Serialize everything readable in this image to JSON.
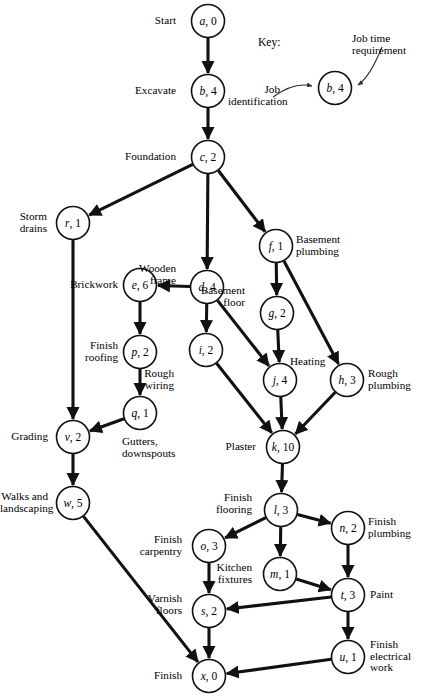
{
  "figure": {
    "type": "project-network-diagram",
    "title": "",
    "width": 426,
    "height": 698,
    "background": "#ffffff",
    "line_color": "#111111"
  },
  "key": {
    "title": "Key:",
    "sample_node": {
      "id": "b",
      "time": "4",
      "text": "b, 4"
    },
    "job_identification_label": "Job\nidentification",
    "job_time_label": "Job time\nrequirement"
  },
  "nodes": [
    {
      "id": "a",
      "time": "0",
      "text": "a, 0",
      "label": "Start",
      "label_pos": "left"
    },
    {
      "id": "b",
      "time": "4",
      "text": "b, 4",
      "label": "Excavate",
      "label_pos": "left"
    },
    {
      "id": "c",
      "time": "2",
      "text": "c, 2",
      "label": "Foundation",
      "label_pos": "left"
    },
    {
      "id": "r",
      "time": "1",
      "text": "r, 1",
      "label": "Storm\ndrains",
      "label_pos": "left"
    },
    {
      "id": "d",
      "time": "4",
      "text": "d, 4",
      "label": "Wooden\nframe",
      "label_pos": "left"
    },
    {
      "id": "f",
      "time": "1",
      "text": "f, 1",
      "label": "Basement\nplumbing",
      "label_pos": "right"
    },
    {
      "id": "e",
      "time": "6",
      "text": "e, 6",
      "label": "Brickwork",
      "label_pos": "left"
    },
    {
      "id": "g",
      "time": "2",
      "text": "g, 2",
      "label": "Basement\nfloor",
      "label_pos": "left"
    },
    {
      "id": "p",
      "time": "2",
      "text": "p, 2",
      "label": "Finish\nroofing",
      "label_pos": "left"
    },
    {
      "id": "i",
      "time": "2",
      "text": "i, 2",
      "label": "Rough\nwiring",
      "label_pos": "below-left"
    },
    {
      "id": "j",
      "time": "4",
      "text": "j, 4",
      "label": "Heating",
      "label_pos": "right"
    },
    {
      "id": "h",
      "time": "3",
      "text": "h, 3",
      "label": "Rough\nplumbing",
      "label_pos": "right"
    },
    {
      "id": "q",
      "time": "1",
      "text": "q, 1",
      "label": "Gutters,\ndownspouts",
      "label_pos": "below"
    },
    {
      "id": "v",
      "time": "2",
      "text": "v, 2",
      "label": "Grading",
      "label_pos": "left"
    },
    {
      "id": "k",
      "time": "10",
      "text": "k, 10",
      "label": "Plaster",
      "label_pos": "left"
    },
    {
      "id": "w",
      "time": "5",
      "text": "w, 5",
      "label": "Walks and\nlandscaping",
      "label_pos": "left"
    },
    {
      "id": "l",
      "time": "3",
      "text": "l, 3",
      "label": "Finish\nflooring",
      "label_pos": "left"
    },
    {
      "id": "n",
      "time": "2",
      "text": "n, 2",
      "label": "Finish\nplumbing",
      "label_pos": "right"
    },
    {
      "id": "o",
      "time": "3",
      "text": "o, 3",
      "label": "Finish\ncarpentry",
      "label_pos": "left"
    },
    {
      "id": "m",
      "time": "1",
      "text": "m, 1",
      "label": "Kitchen\nfixtures",
      "label_pos": "left"
    },
    {
      "id": "t",
      "time": "3",
      "text": "t, 3",
      "label": "Paint",
      "label_pos": "right"
    },
    {
      "id": "s",
      "time": "2",
      "text": "s, 2",
      "label": "Varnish\nfloors",
      "label_pos": "left"
    },
    {
      "id": "u",
      "time": "1",
      "text": "u, 1",
      "label": "Finish\nelectrical\nwork",
      "label_pos": "right"
    },
    {
      "id": "x",
      "time": "0",
      "text": "x, 0",
      "label": "Finish",
      "label_pos": "left"
    }
  ],
  "edges": [
    {
      "from": "a",
      "to": "b"
    },
    {
      "from": "b",
      "to": "c"
    },
    {
      "from": "c",
      "to": "r"
    },
    {
      "from": "c",
      "to": "d"
    },
    {
      "from": "c",
      "to": "f"
    },
    {
      "from": "d",
      "to": "e"
    },
    {
      "from": "d",
      "to": "i"
    },
    {
      "from": "d",
      "to": "j"
    },
    {
      "from": "e",
      "to": "p"
    },
    {
      "from": "f",
      "to": "g"
    },
    {
      "from": "f",
      "to": "h"
    },
    {
      "from": "g",
      "to": "j"
    },
    {
      "from": "p",
      "to": "q"
    },
    {
      "from": "q",
      "to": "v"
    },
    {
      "from": "r",
      "to": "v"
    },
    {
      "from": "i",
      "to": "k"
    },
    {
      "from": "j",
      "to": "k"
    },
    {
      "from": "h",
      "to": "k"
    },
    {
      "from": "v",
      "to": "w"
    },
    {
      "from": "k",
      "to": "l"
    },
    {
      "from": "l",
      "to": "o"
    },
    {
      "from": "l",
      "to": "m"
    },
    {
      "from": "l",
      "to": "n"
    },
    {
      "from": "o",
      "to": "s"
    },
    {
      "from": "m",
      "to": "t"
    },
    {
      "from": "n",
      "to": "t"
    },
    {
      "from": "t",
      "to": "s"
    },
    {
      "from": "t",
      "to": "u"
    },
    {
      "from": "s",
      "to": "x"
    },
    {
      "from": "u",
      "to": "x"
    },
    {
      "from": "w",
      "to": "x"
    }
  ],
  "layout": {
    "radius": 16.5,
    "positions": {
      "a": [
        208,
        21
      ],
      "b": [
        208,
        91
      ],
      "c": [
        208,
        157
      ],
      "r": [
        73,
        223
      ],
      "d": [
        207,
        287
      ],
      "f": [
        276,
        246
      ],
      "e": [
        140,
        285
      ],
      "g": [
        277,
        313
      ],
      "p": [
        140,
        352
      ],
      "i": [
        206,
        350
      ],
      "j": [
        280,
        380
      ],
      "h": [
        347,
        380
      ],
      "q": [
        140,
        413
      ],
      "v": [
        73,
        437
      ],
      "k": [
        283,
        447
      ],
      "w": [
        73,
        503
      ],
      "l": [
        281,
        510
      ],
      "n": [
        348,
        528
      ],
      "o": [
        209,
        546
      ],
      "m": [
        280,
        574
      ],
      "t": [
        348,
        595
      ],
      "s": [
        209,
        611
      ],
      "u": [
        348,
        657
      ],
      "x": [
        209,
        676
      ],
      "key": [
        335,
        88
      ]
    },
    "label_offsets": {
      "a": [
        176,
        15,
        "right"
      ],
      "b": [
        176,
        85,
        "right"
      ],
      "c": [
        176,
        151,
        "right"
      ],
      "r": [
        47,
        211,
        "right"
      ],
      "d": [
        176,
        263,
        "right"
      ],
      "f": [
        296,
        234,
        "left"
      ],
      "e": [
        118,
        279,
        "right"
      ],
      "g": [
        245,
        285,
        "right"
      ],
      "p": [
        118,
        340,
        "right"
      ],
      "i": [
        174,
        368,
        "right"
      ],
      "j": [
        290,
        356,
        "left"
      ],
      "h": [
        368,
        368,
        "left"
      ],
      "q": [
        122,
        436,
        "left"
      ],
      "v": [
        48,
        431,
        "right"
      ],
      "k": [
        256,
        441,
        "right"
      ],
      "w": [
        48,
        491,
        "right"
      ],
      "l": [
        252,
        492,
        "right"
      ],
      "n": [
        368,
        516,
        "left"
      ],
      "o": [
        182,
        534,
        "right"
      ],
      "m": [
        252,
        562,
        "right"
      ],
      "t": [
        370,
        589,
        "left"
      ],
      "s": [
        182,
        593,
        "right"
      ],
      "u": [
        370,
        639,
        "left"
      ],
      "x": [
        182,
        670,
        "right"
      ]
    }
  }
}
